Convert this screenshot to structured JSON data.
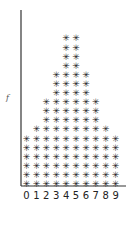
{
  "chart_data": {
    "type": "bar",
    "style": "asterisk-stack",
    "title": "",
    "xlabel": "",
    "ylabel": "f",
    "categories": [
      "0",
      "1",
      "2",
      "3",
      "4",
      "5",
      "6",
      "7",
      "8",
      "9"
    ],
    "values": [
      6,
      7,
      10,
      13,
      17,
      17,
      13,
      10,
      7,
      6
    ],
    "symbol": "*",
    "ylim": [
      0,
      19
    ],
    "grid": false,
    "legend": null
  },
  "colors": {
    "ink": "#222222",
    "axis": "#333333",
    "background": "#ffffff"
  }
}
